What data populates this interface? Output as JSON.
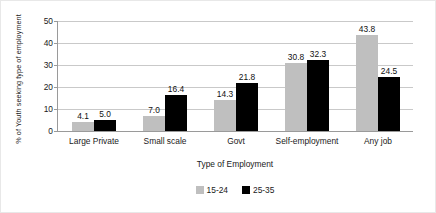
{
  "chart_data": {
    "type": "bar",
    "title": "",
    "subtitle": "",
    "xlabel": "Type of Employment",
    "ylabel": "% of  Youth seeking type of employment",
    "categories": [
      "Large Private",
      "Small scale",
      "Govt",
      "Self-employment",
      "Any job"
    ],
    "series": [
      {
        "name": "15-24",
        "color": "#bfbfbf",
        "values": [
          4.1,
          7.0,
          14.3,
          30.8,
          43.8
        ],
        "labels": [
          "4.1",
          "7.0",
          "14.3",
          "30.8",
          "43.8"
        ]
      },
      {
        "name": "25-35",
        "color": "#000000",
        "values": [
          5.0,
          16.4,
          21.8,
          32.3,
          24.5
        ],
        "labels": [
          "5.0",
          "16.4",
          "21.8",
          "32.3",
          "24.5"
        ]
      }
    ],
    "ylim": [
      0,
      50
    ],
    "yticks": [
      0,
      10,
      20,
      30,
      40,
      50
    ],
    "ytick_labels": [
      "0",
      "10",
      "20",
      "30",
      "40",
      "50"
    ],
    "grid": true,
    "legend_position": "bottom"
  }
}
